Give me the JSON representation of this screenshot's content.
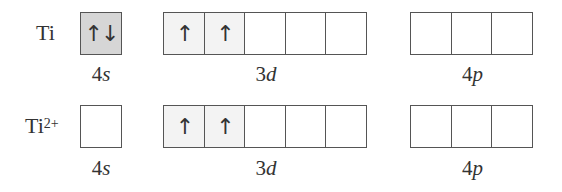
{
  "rows": [
    {
      "species": "Ti",
      "charge": "",
      "subshells": [
        {
          "name": "4s",
          "number": "4",
          "letter": "s",
          "orbitals": [
            "↑↓"
          ]
        },
        {
          "name": "3d",
          "number": "3",
          "letter": "d",
          "orbitals": [
            "↑",
            "↑",
            "",
            "",
            ""
          ]
        },
        {
          "name": "4p",
          "number": "4",
          "letter": "p",
          "orbitals": [
            "",
            "",
            ""
          ]
        }
      ]
    },
    {
      "species": "Ti",
      "charge": "2+",
      "subshells": [
        {
          "name": "4s",
          "number": "4",
          "letter": "s",
          "orbitals": [
            ""
          ]
        },
        {
          "name": "3d",
          "number": "3",
          "letter": "d",
          "orbitals": [
            "↑",
            "↑",
            "",
            "",
            ""
          ]
        },
        {
          "name": "4p",
          "number": "4",
          "letter": "p",
          "orbitals": [
            "",
            "",
            ""
          ]
        }
      ]
    }
  ]
}
